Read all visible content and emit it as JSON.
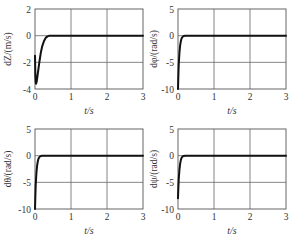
{
  "chart_data": [
    {
      "type": "line",
      "title": "",
      "xlabel": "t/s",
      "ylabel": "dZ/(m/s)",
      "xlim": [
        0,
        3
      ],
      "ylim": [
        -4,
        2
      ],
      "xticks": [
        0,
        1,
        2,
        3
      ],
      "yticks": [
        2,
        0,
        -2,
        -4
      ],
      "grid": true,
      "series": [
        {
          "name": "dZ",
          "x": [
            0,
            0.01,
            0.02,
            0.03,
            0.05,
            0.08,
            0.12,
            0.16,
            0.2,
            0.25,
            0.3,
            0.35,
            0.4,
            0.5,
            1,
            2,
            3
          ],
          "y": [
            -1.5,
            -3.0,
            -3.5,
            -3.6,
            -3.4,
            -2.8,
            -2.0,
            -1.3,
            -0.8,
            -0.4,
            -0.15,
            -0.05,
            0,
            0,
            0,
            0,
            0
          ]
        }
      ]
    },
    {
      "type": "line",
      "title": "",
      "xlabel": "t/s",
      "ylabel": "dφ/(rad/s)",
      "xlim": [
        0,
        3
      ],
      "ylim": [
        -10,
        5
      ],
      "xticks": [
        0,
        1,
        2,
        3
      ],
      "yticks": [
        5,
        0,
        -5,
        -10
      ],
      "grid": true,
      "series": [
        {
          "name": "dφ",
          "x": [
            0,
            0.01,
            0.02,
            0.04,
            0.06,
            0.08,
            0.1,
            0.13,
            0.16,
            0.2,
            0.3,
            1,
            2,
            3
          ],
          "y": [
            -10,
            -7.5,
            -5.5,
            -3.2,
            -1.8,
            -1.0,
            -0.5,
            -0.2,
            -0.05,
            0,
            0,
            0,
            0,
            0
          ]
        }
      ]
    },
    {
      "type": "line",
      "title": "",
      "xlabel": "t/s",
      "ylabel": "dθ/(rad/s)",
      "xlim": [
        0,
        3
      ],
      "ylim": [
        -10,
        5
      ],
      "xticks": [
        0,
        1,
        2,
        3
      ],
      "yticks": [
        5,
        0,
        -5,
        -10
      ],
      "grid": true,
      "series": [
        {
          "name": "dθ",
          "x": [
            0,
            0.01,
            0.02,
            0.04,
            0.06,
            0.08,
            0.1,
            0.13,
            0.16,
            0.2,
            0.3,
            1,
            2,
            3
          ],
          "y": [
            -10,
            -7.5,
            -5.5,
            -3.2,
            -1.8,
            -1.0,
            -0.5,
            -0.2,
            -0.05,
            0,
            0,
            0,
            0,
            0
          ]
        }
      ]
    },
    {
      "type": "line",
      "title": "",
      "xlabel": "t/s",
      "ylabel": "dψ/(rad/s)",
      "xlim": [
        0,
        3
      ],
      "ylim": [
        -10,
        5
      ],
      "xticks": [
        0,
        1,
        2,
        3
      ],
      "yticks": [
        5,
        0,
        -5,
        -10
      ],
      "grid": true,
      "series": [
        {
          "name": "dψ",
          "x": [
            0,
            0.01,
            0.02,
            0.04,
            0.06,
            0.08,
            0.1,
            0.13,
            0.16,
            0.2,
            0.3,
            1,
            2,
            3
          ],
          "y": [
            -8,
            -6.0,
            -4.5,
            -2.6,
            -1.5,
            -0.8,
            -0.4,
            -0.15,
            -0.05,
            0,
            0,
            0,
            0,
            0
          ]
        }
      ]
    }
  ],
  "layout": {
    "panels": [
      {
        "left": 35,
        "top": 9,
        "width": 108,
        "height": 80,
        "ylabel_x": 11
      },
      {
        "left": 178,
        "top": 9,
        "width": 108,
        "height": 80,
        "ylabel_x": 157
      },
      {
        "left": 35,
        "top": 129,
        "width": 108,
        "height": 80,
        "ylabel_x": 11
      },
      {
        "left": 178,
        "top": 129,
        "width": 108,
        "height": 80,
        "ylabel_x": 157
      }
    ],
    "colors": {
      "axis": "#555555",
      "grid": "#666666",
      "line": "#111111",
      "text": "#333333"
    }
  }
}
